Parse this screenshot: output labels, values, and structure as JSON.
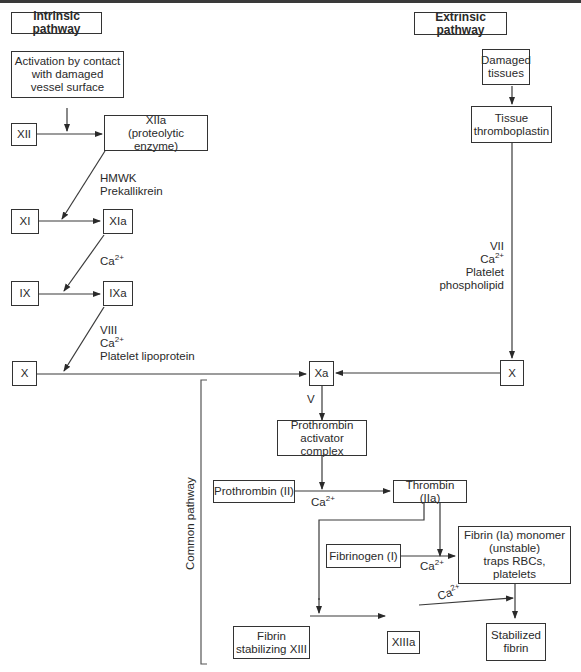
{
  "diagram": {
    "type": "flowchart",
    "headers": {
      "intrinsic": "Intrinsic pathway",
      "extrinsic": "Extrinsic pathway",
      "common": "Common pathway"
    },
    "intrinsic": {
      "activation": "Activation by contact\nwith damaged\nvessel surface",
      "xii": "XII",
      "xiia": "XIIa\n(proteolytic enzyme)",
      "cofactors_1": "HMWK\nPrekallikrein",
      "xi": "XI",
      "xia": "XIa",
      "cofactors_2_base": "Ca",
      "cofactors_2_sup": "2+",
      "ix": "IX",
      "ixa": "IXa",
      "cofactors_3_line1": "VIII",
      "cofactors_3_ca": "Ca",
      "cofactors_3_sup": "2+",
      "cofactors_3_line3": "Platelet lipoprotein",
      "x": "X"
    },
    "extrinsic": {
      "damaged": "Damaged\ntissues",
      "thromboplastin": "Tissue\nthromboplastin",
      "cofactor_line1": "VII",
      "cofactor_ca": "Ca",
      "cofactor_sup": "2+",
      "cofactor_line3": "Platelet phospholipid",
      "x": "X"
    },
    "common": {
      "xa": "Xa",
      "v": "V",
      "activator": "Prothrombin\nactivator complex",
      "prothrombin": "Prothrombin (II)",
      "ca1_base": "Ca",
      "ca1_sup": "2+",
      "thrombin": "Thrombin (IIa)",
      "fibrinogen": "Fibrinogen (I)",
      "ca2_base": "Ca",
      "ca2_sup": "2+",
      "fibrin_monomer": "Fibrin (Ia) monomer\n(unstable)\ntraps RBCs,\nplatelets",
      "fibrin_xiii": "Fibrin\nstabilizing XIII",
      "xiiia": "XIIIa",
      "ca3_base": "Ca",
      "ca3_sup": "2+",
      "stabilized": "Stabilized\nfibrin"
    }
  }
}
